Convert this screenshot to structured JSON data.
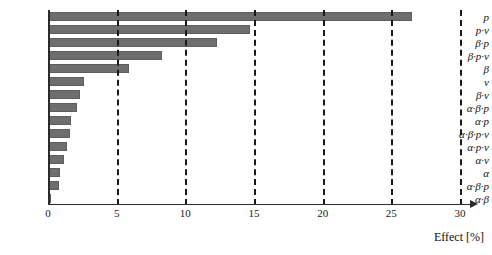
{
  "chart_data": {
    "type": "bar",
    "orientation": "horizontal",
    "title": "",
    "xlabel": "Effect [%]",
    "ylabel": "",
    "xlim": [
      0,
      30
    ],
    "xticks": [
      0,
      5,
      10,
      15,
      20,
      25,
      30
    ],
    "xtick_labels": [
      "0",
      "5",
      "10",
      "15",
      "20",
      "25",
      "30"
    ],
    "grid": "vertical-dashed",
    "legend": "none",
    "bar_color": "#6e6e6e",
    "categories": [
      "p",
      "p·v",
      "β·p",
      "β·p·v",
      "β",
      "v",
      "β·v",
      "α·β·p",
      "α·p",
      "α·β·p·v",
      "α·p·v",
      "α·v",
      "α",
      "α·β·p",
      "α·β"
    ],
    "values": [
      26.5,
      14.7,
      12.3,
      8.3,
      5.9,
      2.6,
      2.3,
      2.1,
      1.7,
      1.6,
      1.4,
      1.2,
      0.9,
      0.8,
      0.2
    ]
  }
}
